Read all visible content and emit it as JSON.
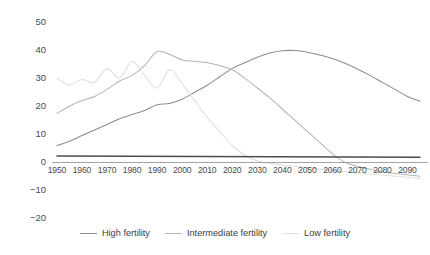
{
  "chart_data": {
    "type": "line",
    "title": "",
    "subtitle": "",
    "xlabel": "",
    "ylabel": "",
    "xlim": [
      1950,
      2095
    ],
    "ylim": [
      -20,
      50
    ],
    "grid": false,
    "legend_position": "bottom",
    "y_ticks": [
      50,
      40,
      30,
      20,
      10,
      0,
      -10,
      -20
    ],
    "y_tick_labels": [
      "50",
      "40",
      "30",
      "20",
      "10",
      "0",
      "−10",
      "−20"
    ],
    "x_ticks": [
      1950,
      1960,
      1970,
      1980,
      1990,
      2000,
      2010,
      2020,
      2030,
      2040,
      2050,
      2060,
      2070,
      2080,
      2090
    ],
    "x_tick_labels": [
      "1950",
      "1960",
      "1970",
      "1980",
      "1990",
      "2000",
      "2010",
      "2020",
      "2030",
      "2040",
      "2050",
      "2060",
      "2070",
      "2080",
      "2090"
    ],
    "series": [
      {
        "name": "High fertility",
        "color": "#8c8c8c",
        "x": [
          1950,
          1955,
          1960,
          1965,
          1970,
          1975,
          1980,
          1985,
          1990,
          1995,
          2000,
          2005,
          2010,
          2015,
          2020,
          2025,
          2030,
          2035,
          2040,
          2045,
          2050,
          2055,
          2060,
          2065,
          2070,
          2075,
          2080,
          2085,
          2090,
          2095
        ],
        "values": [
          6.0,
          7.5,
          9.5,
          11.5,
          13.5,
          15.5,
          17.0,
          18.5,
          20.5,
          21.0,
          22.5,
          25.0,
          27.5,
          30.5,
          33.5,
          35.5,
          37.5,
          39.0,
          39.8,
          39.9,
          39.3,
          38.3,
          37.0,
          35.3,
          33.3,
          31.0,
          28.5,
          26.0,
          23.5,
          21.8
        ]
      },
      {
        "name": "Intermediate fertility",
        "color": "#b4b4b4",
        "x": [
          1950,
          1955,
          1960,
          1965,
          1970,
          1975,
          1980,
          1985,
          1990,
          1995,
          2000,
          2005,
          2010,
          2015,
          2020,
          2025,
          2030,
          2035,
          2040,
          2045,
          2050,
          2055,
          2060,
          2065,
          2070,
          2075,
          2080,
          2085,
          2090,
          2095
        ],
        "values": [
          17.5,
          20.0,
          22.0,
          23.5,
          26.0,
          29.0,
          31.0,
          34.5,
          39.5,
          38.5,
          36.5,
          36.0,
          35.5,
          34.5,
          33.0,
          30.0,
          26.5,
          23.0,
          19.0,
          15.0,
          11.0,
          7.0,
          3.0,
          0.0,
          -1.5,
          -2.5,
          -3.5,
          -4.0,
          -4.5,
          -5.0
        ]
      },
      {
        "name": "Low fertility",
        "color": "#dedede",
        "x": [
          1950,
          1955,
          1960,
          1965,
          1970,
          1975,
          1980,
          1985,
          1990,
          1995,
          2000,
          2005,
          2010,
          2015,
          2020,
          2025,
          2030,
          2035,
          2040,
          2045,
          2050,
          2055,
          2060,
          2065,
          2070,
          2075,
          2080,
          2085,
          2090,
          2095
        ],
        "values": [
          30.0,
          27.5,
          29.5,
          28.5,
          33.5,
          30.0,
          36.0,
          31.0,
          26.5,
          33.0,
          28.0,
          22.0,
          16.0,
          11.0,
          6.0,
          2.5,
          0.5,
          -0.5,
          -1.0,
          -1.5,
          -2.0,
          -2.5,
          -3.0,
          -3.4,
          -3.8,
          -4.2,
          -4.6,
          -5.0,
          -5.4,
          -5.8
        ]
      },
      {
        "name": "Reference line",
        "color": "#4d4d4d",
        "x": [
          1950,
          2095
        ],
        "values": [
          2.2,
          1.8
        ]
      }
    ]
  },
  "legend": {
    "entries": [
      {
        "label": "High fertility",
        "color": "#8c8c8c"
      },
      {
        "label": "Intermediate fertility",
        "color": "#b4b4b4"
      },
      {
        "label": "Low fertility",
        "color": "#e2e2e2"
      }
    ]
  },
  "axis": {
    "baseline_color": "#9a9a9a"
  }
}
